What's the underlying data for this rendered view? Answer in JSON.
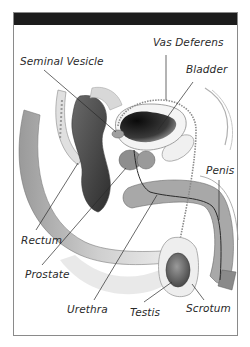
{
  "figure": {
    "header_bar_color": "#1c1c1c",
    "frame_border_color": "#8a8a8a",
    "labels": [
      {
        "id": "seminal-vesicle",
        "text": "Seminal Vesicle",
        "x": 20,
        "y": 55
      },
      {
        "id": "vas-deferens",
        "text": "Vas Deferens",
        "x": 153,
        "y": 36
      },
      {
        "id": "bladder",
        "text": "Bladder",
        "x": 186,
        "y": 63
      },
      {
        "id": "penis",
        "text": "Penis",
        "x": 206,
        "y": 164
      },
      {
        "id": "rectum",
        "text": "Rectum",
        "x": 21,
        "y": 234
      },
      {
        "id": "prostate",
        "text": "Prostate",
        "x": 25,
        "y": 268
      },
      {
        "id": "urethra",
        "text": "Urethra",
        "x": 67,
        "y": 303
      },
      {
        "id": "testis",
        "text": "Testis",
        "x": 130,
        "y": 306
      },
      {
        "id": "scrotum",
        "text": "Scrotum",
        "x": 186,
        "y": 302
      }
    ]
  }
}
